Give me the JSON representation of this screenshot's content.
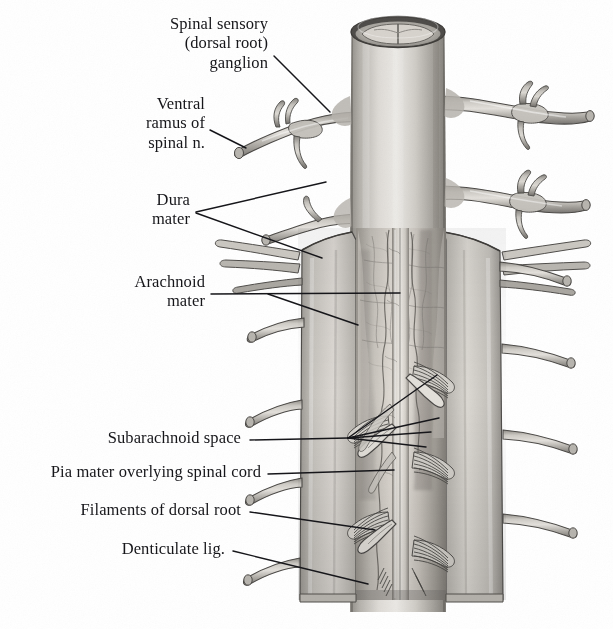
{
  "figure": {
    "background_color": "#ffffff",
    "ink_color": "#16161a",
    "palette": {
      "tissue_light": "#e8e6e2",
      "tissue_mid": "#b9b6b0",
      "tissue_dark": "#8d8a85",
      "tissue_shadow": "#5f5d5a",
      "outline": "#3a3936",
      "cord_pale": "#d9d6d1",
      "nerve_light": "#cdcac5",
      "nerve_dark": "#7b7873"
    }
  },
  "labels": [
    {
      "id": "spinal-sensory-ganglion",
      "lines": [
        "Spinal sensory",
        "(dorsal root)",
        "ganglion"
      ],
      "text": "Spinal sensory (dorsal root) ganglion",
      "align": "right",
      "x": 268,
      "y": 14,
      "leaders": [
        {
          "x1": 274,
          "y1": 56,
          "x2": 330,
          "y2": 112
        }
      ]
    },
    {
      "id": "ventral-ramus",
      "lines": [
        "Ventral",
        "ramus of",
        "spinal n."
      ],
      "text": "Ventral ramus of spinal n.",
      "align": "right",
      "x": 205,
      "y": 94,
      "leaders": [
        {
          "x1": 210,
          "y1": 130,
          "x2": 246,
          "y2": 148
        }
      ]
    },
    {
      "id": "dura-mater",
      "lines": [
        "Dura",
        "mater"
      ],
      "text": "Dura mater",
      "align": "right",
      "x": 190,
      "y": 190,
      "leaders": [
        {
          "x1": 196,
          "y1": 212,
          "x2": 326,
          "y2": 182
        },
        {
          "x1": 196,
          "y1": 213,
          "x2": 322,
          "y2": 258
        }
      ]
    },
    {
      "id": "arachnoid-mater",
      "lines": [
        "Arachnoid",
        "mater"
      ],
      "text": "Arachnoid mater",
      "align": "right",
      "x": 205,
      "y": 272,
      "leaders": [
        {
          "x1": 211,
          "y1": 294,
          "x2": 400,
          "y2": 293
        },
        {
          "x1": 268,
          "y1": 294,
          "x2": 358,
          "y2": 325
        }
      ]
    },
    {
      "id": "subarachnoid-space",
      "lines": [
        "Subarachnoid space"
      ],
      "text": "Subarachnoid space",
      "align": "right",
      "x": 241,
      "y": 428,
      "leaders": [
        {
          "x1": 250,
          "y1": 440,
          "x2": 348,
          "y2": 438
        },
        {
          "x1": 348,
          "y1": 438,
          "x2": 437,
          "y2": 375
        },
        {
          "x1": 348,
          "y1": 438,
          "x2": 439,
          "y2": 418
        },
        {
          "x1": 348,
          "y1": 438,
          "x2": 431,
          "y2": 432
        },
        {
          "x1": 348,
          "y1": 438,
          "x2": 426,
          "y2": 447
        }
      ]
    },
    {
      "id": "pia-mater",
      "lines": [
        "Pia mater overlying spinal cord"
      ],
      "text": "Pia mater overlying spinal cord",
      "align": "right",
      "x": 261,
      "y": 462,
      "leaders": [
        {
          "x1": 268,
          "y1": 474,
          "x2": 394,
          "y2": 470
        }
      ]
    },
    {
      "id": "filaments-dorsal-root",
      "lines": [
        "Filaments of dorsal root"
      ],
      "text": "Filaments of dorsal root",
      "align": "right",
      "x": 241,
      "y": 500,
      "leaders": [
        {
          "x1": 250,
          "y1": 512,
          "x2": 375,
          "y2": 530
        }
      ]
    },
    {
      "id": "denticulate-ligament",
      "lines": [
        "Denticulate lig."
      ],
      "text": "Denticulate lig.",
      "align": "right",
      "x": 225,
      "y": 539,
      "leaders": [
        {
          "x1": 233,
          "y1": 551,
          "x2": 368,
          "y2": 584
        }
      ]
    }
  ],
  "anatomy": {
    "dural_tube": {
      "name": "dural sac",
      "top_y": 18,
      "bottom_y": 600,
      "left_x": 352,
      "right_x": 444
    },
    "cut_rim": {
      "name": "cut edge of dura at superior end",
      "cx": 398,
      "cy": 30
    },
    "opened_window": {
      "name": "reflected dura exposing arachnoid and cord",
      "left_x": 298,
      "right_x": 505,
      "top_y": 228,
      "bottom_y": 600
    },
    "spinal_nerve_pairs": [
      {
        "level": 1,
        "y_left": 152,
        "y_right": 108,
        "has_ganglion": true
      },
      {
        "level": 2,
        "y_left": 248,
        "y_right": 196,
        "has_ganglion": true
      },
      {
        "level": 3,
        "y_left": 330,
        "y_right": 258,
        "has_ganglion": false
      },
      {
        "level": 4,
        "y_left": 412,
        "y_right": 345,
        "has_ganglion": false
      },
      {
        "level": 5,
        "y_left": 487,
        "y_right": 432,
        "has_ganglion": false
      },
      {
        "level": 6,
        "y_left": 566,
        "y_right": 516,
        "has_ganglion": false
      }
    ],
    "rootlet_fans": [
      {
        "side": "left",
        "y": 432
      },
      {
        "side": "left",
        "y": 528
      },
      {
        "side": "right",
        "y": 382
      },
      {
        "side": "right",
        "y": 468
      },
      {
        "side": "right",
        "y": 556
      }
    ],
    "denticulate_ligaments": [
      {
        "side": "left",
        "y": 447
      },
      {
        "side": "left",
        "y": 543
      },
      {
        "side": "right",
        "y": 400
      }
    ]
  }
}
